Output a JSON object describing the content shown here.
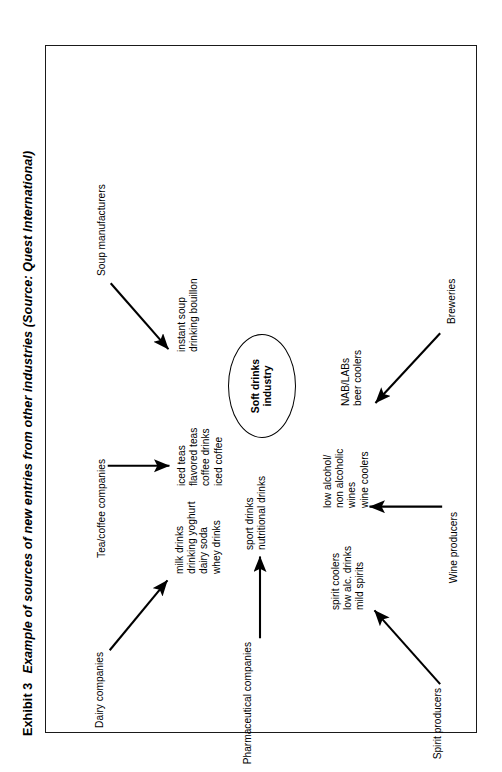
{
  "caption": {
    "exhibit_number": "Exhibit 3",
    "title": "Example of sources of new entries from other industries (Source: Quest International)"
  },
  "hub": {
    "label": "Soft drinks\nindustry"
  },
  "diagram": {
    "type": "influence-diagram",
    "orientation": "rotated-90-ccw",
    "center_node": "Soft drinks industry",
    "sources": [
      {
        "id": "spirit-producers",
        "source": "Spirit producers",
        "products": "spirit coolers\nlow alc. drinks\nmild spirits",
        "arrow": "diagonal-up-right"
      },
      {
        "id": "wine-producers",
        "source": "Wine producers",
        "products": "low alcohol/\nnon alcoholic\nwines\nwine coolers",
        "arrow": "straight-up"
      },
      {
        "id": "breweries",
        "source": "Breweries",
        "products": "NAB/LABs\nbeer coolers",
        "arrow": "diagonal-up-left"
      },
      {
        "id": "pharmaceutical-companies",
        "source": "Pharmaceutical companies",
        "products": "sport drinks\nnutritional drinks",
        "arrow": "straight-right"
      },
      {
        "id": "dairy-companies",
        "source": "Dairy companies",
        "products": "milk drinks\ndrinking yoghurt\ndairy soda\nwhey drinks",
        "arrow": "diagonal-down-right"
      },
      {
        "id": "tea-coffee-companies",
        "source": "Tea/coffee companies",
        "products": "iced teas\nflavored teas\ncoffee drinks\niced coffee",
        "arrow": "straight-down"
      },
      {
        "id": "soup-manufacturers",
        "source": "Soup manufacturers",
        "products": "instant soup\ndrinking bouillon",
        "arrow": "diagonal-down-left"
      }
    ]
  },
  "colors": {
    "ink": "#000000",
    "frame": "#1a1a1a",
    "paper": "#ffffff"
  }
}
